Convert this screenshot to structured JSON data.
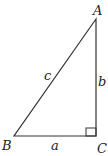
{
  "diagram": {
    "type": "right-triangle",
    "vertices": {
      "A": {
        "label": "A"
      },
      "B": {
        "label": "B"
      },
      "C": {
        "label": "C"
      }
    },
    "sides": {
      "a": {
        "label": "a"
      },
      "b": {
        "label": "b"
      },
      "c": {
        "label": "c"
      }
    },
    "right_angle_at": "C",
    "stroke_color": "#333333"
  }
}
